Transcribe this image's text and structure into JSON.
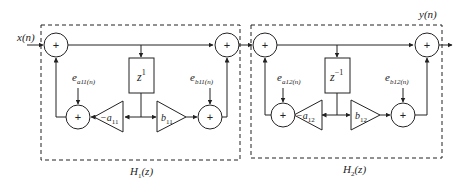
{
  "diagram": {
    "input_label": "x(n)",
    "output_label": "y(n)",
    "adder_symbol": "+",
    "stages": [
      {
        "name": "H1(z)",
        "label_main": "H",
        "label_sub": "1",
        "label_tail": "(z)",
        "delay_main": "z",
        "delay_exp": "1",
        "coef_a_prefix": "−a",
        "coef_a_sub": "11",
        "coef_b_prefix": "b",
        "coef_b_sub": "11",
        "error_a_main": "e",
        "error_a_sub": "a11(n)",
        "error_b_main": "e",
        "error_b_sub": "b11(n)"
      },
      {
        "name": "H2(z)",
        "label_main": "H",
        "label_sub": "2",
        "label_tail": "(z)",
        "delay_main": "z",
        "delay_exp": "−1",
        "coef_a_prefix": "−a",
        "coef_a_sub": "12",
        "coef_b_prefix": "b",
        "coef_b_sub": "12",
        "error_a_main": "e",
        "error_a_sub": "a12(n)",
        "error_b_main": "e",
        "error_b_sub": "b12(n)"
      }
    ],
    "colors": {
      "line": "#222222",
      "background": "#ffffff"
    }
  }
}
